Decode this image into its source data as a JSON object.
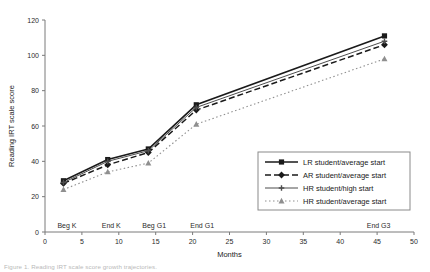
{
  "figure": {
    "caption": "Figure 1. Reading IRT scale score growth trajectories."
  },
  "chart_data": {
    "type": "line",
    "title": "",
    "xlabel": "Months",
    "ylabel": "Reading IRT scale score",
    "xlim": [
      0,
      50
    ],
    "ylim": [
      0,
      120
    ],
    "xticks": [
      0,
      5,
      10,
      15,
      20,
      25,
      30,
      35,
      40,
      45,
      50
    ],
    "yticks": [
      0,
      20,
      40,
      60,
      80,
      100,
      120
    ],
    "grid": false,
    "legend_position": "center-right",
    "x": [
      2.5,
      8.5,
      14,
      20.5,
      46
    ],
    "event_labels": [
      {
        "text": "Beg K",
        "x": 2.5
      },
      {
        "text": "End K",
        "x": 8.5
      },
      {
        "text": "Beg G1",
        "x": 14
      },
      {
        "text": "End G1",
        "x": 20.5
      },
      {
        "text": "End G3",
        "x": 46
      }
    ],
    "series": [
      {
        "name": "LR student/average start",
        "marker": "square",
        "linestyle": "solid",
        "color": "#1a1a1a",
        "values": [
          29,
          41,
          47,
          72,
          111
        ]
      },
      {
        "name": "AR student/average start",
        "marker": "diamond",
        "linestyle": "dashed",
        "color": "#1a1a1a",
        "values": [
          27.5,
          38,
          45,
          69,
          106
        ]
      },
      {
        "name": "HR student/high start",
        "marker": "cross",
        "linestyle": "solid-thin",
        "color": "#4d4d4d",
        "values": [
          28,
          40,
          46,
          70.5,
          108
        ]
      },
      {
        "name": "HR student/average start",
        "marker": "triangle",
        "linestyle": "dotted",
        "color": "#8f8f8f",
        "values": [
          24,
          34,
          39,
          61,
          98
        ]
      }
    ]
  }
}
